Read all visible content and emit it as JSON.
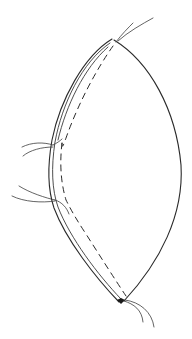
{
  "figure": {
    "background_color": "#ffffff",
    "line_color": "#2a2a2a",
    "seam_dash": "6 5",
    "parts": [
      {
        "name": "fabric-outline-right",
        "label": ""
      },
      {
        "name": "fabric-outline-left-outer",
        "label": ""
      },
      {
        "name": "fabric-outline-left-inner",
        "label": ""
      },
      {
        "name": "seam-line-dashed",
        "label": ""
      },
      {
        "name": "thread-tails-top",
        "label": ""
      },
      {
        "name": "thread-tails-left-upper",
        "label": ""
      },
      {
        "name": "thread-tails-left-lower",
        "label": ""
      },
      {
        "name": "thread-tails-bottom",
        "label": ""
      }
    ]
  }
}
